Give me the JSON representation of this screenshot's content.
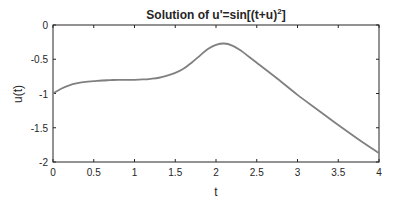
{
  "chart_data": {
    "type": "line",
    "title_main": "Solution of u'=sin[(t+u)",
    "title_sup": "2",
    "title_end": "]",
    "xlabel": "t",
    "ylabel": "u(t)",
    "xlim": [
      0,
      4
    ],
    "ylim": [
      -2,
      0
    ],
    "xticks": [
      0,
      0.5,
      1,
      1.5,
      2,
      2.5,
      3,
      3.5,
      4
    ],
    "xtick_labels": [
      "0",
      "0.5",
      "1",
      "1.5",
      "2",
      "2.5",
      "3",
      "3.5",
      "4"
    ],
    "yticks": [
      0,
      -0.5,
      -1,
      -1.5,
      -2
    ],
    "ytick_labels": [
      "0",
      "-0.5",
      "-1",
      "-1.5",
      "-2"
    ],
    "grid": false,
    "series": [
      {
        "name": "u(t)",
        "color": "#808080",
        "x": [
          0,
          0.1,
          0.2,
          0.3,
          0.4,
          0.5,
          0.6,
          0.7,
          0.8,
          0.9,
          1.0,
          1.1,
          1.2,
          1.3,
          1.4,
          1.5,
          1.6,
          1.7,
          1.8,
          1.9,
          2.0,
          2.1,
          2.2,
          2.3,
          2.4,
          2.5,
          2.75,
          3.0,
          3.25,
          3.5,
          3.75,
          4.0
        ],
        "y": [
          -1.0,
          -0.93,
          -0.88,
          -0.85,
          -0.83,
          -0.82,
          -0.81,
          -0.805,
          -0.8,
          -0.8,
          -0.8,
          -0.795,
          -0.785,
          -0.77,
          -0.74,
          -0.7,
          -0.64,
          -0.55,
          -0.45,
          -0.35,
          -0.29,
          -0.27,
          -0.3,
          -0.37,
          -0.46,
          -0.55,
          -0.78,
          -1.02,
          -1.24,
          -1.46,
          -1.67,
          -1.87
        ]
      }
    ]
  }
}
